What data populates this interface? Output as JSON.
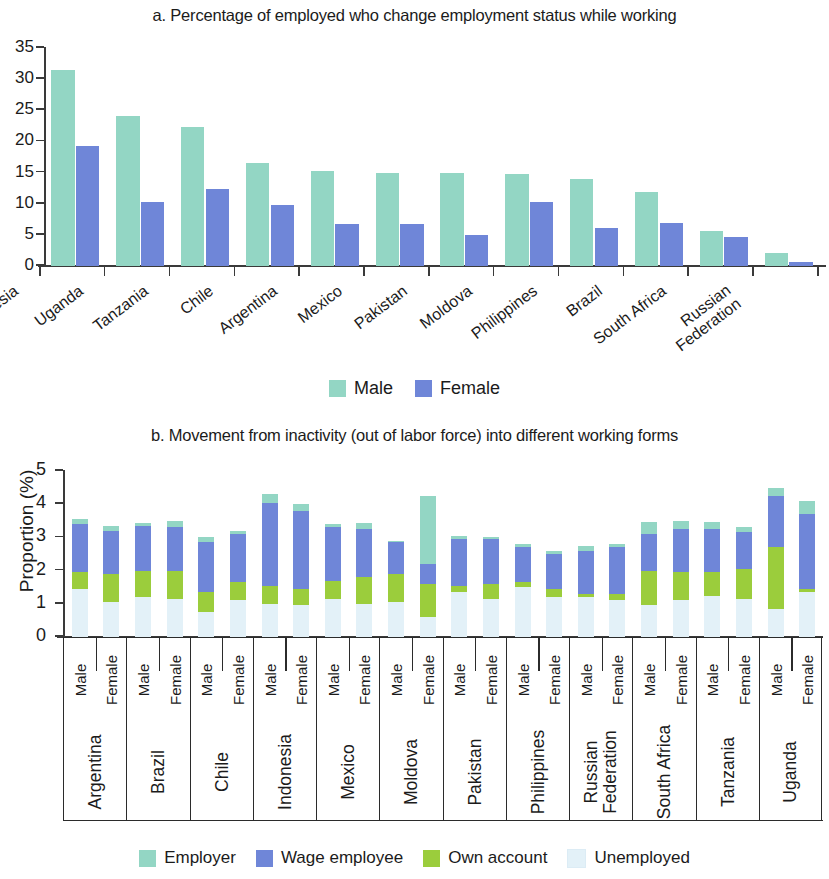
{
  "panel_a": {
    "title": "a. Percentage of employed who change employment status while working",
    "legend": [
      {
        "label": "Male",
        "color": "#93d6c4"
      },
      {
        "label": "Female",
        "color": "#6f86d8"
      }
    ],
    "y_ticks": [
      "0",
      "5",
      "10",
      "15",
      "20",
      "25",
      "30",
      "35"
    ],
    "chart_data": {
      "type": "bar",
      "title": "a. Percentage of employed who change employment status while working",
      "xlabel": "",
      "ylabel": "",
      "ylim": [
        0,
        35
      ],
      "ytick_step": 5,
      "grid": false,
      "legend_position": "bottom",
      "categories": [
        "Indonesia",
        "Uganda",
        "Tanzania",
        "Chile",
        "Argentina",
        "Mexico",
        "Pakistan",
        "Moldova",
        "Philippines",
        "Brazil",
        "South Africa",
        "Russian Federation"
      ],
      "series": [
        {
          "name": "Male",
          "color": "#93d6c4",
          "values": [
            31.4,
            24.1,
            22.3,
            16.5,
            15.3,
            14.9,
            14.9,
            14.7,
            13.9,
            11.9,
            5.6,
            2.1
          ]
        },
        {
          "name": "Female",
          "color": "#6f86d8",
          "values": [
            19.3,
            10.3,
            12.3,
            9.8,
            6.7,
            6.7,
            5.0,
            10.2,
            6.1,
            6.9,
            4.7,
            0.7
          ]
        }
      ]
    }
  },
  "panel_b": {
    "title": "b. Movement from inactivity (out of labor force) into different working forms",
    "y_axis_label": "Proportion (%)",
    "y_ticks": [
      "0",
      "1",
      "2",
      "3",
      "4",
      "5"
    ],
    "sex_labels": [
      "Male",
      "Female"
    ],
    "legend": [
      {
        "label": "Employer",
        "color": "#93d6c4"
      },
      {
        "label": "Wage employee",
        "color": "#6f86d8"
      },
      {
        "label": "Own account",
        "color": "#9bcd3c"
      },
      {
        "label": "Unemployed",
        "color": "#e3f1f8"
      }
    ],
    "chart_data": {
      "type": "bar",
      "subtype": "stacked",
      "title": "b. Movement from inactivity (out of labor force) into different working forms",
      "xlabel": "",
      "ylabel": "Proportion (%)",
      "ylim": [
        0,
        5
      ],
      "ytick_step": 1,
      "grid": false,
      "legend_position": "bottom",
      "stack_order_bottom_to_top": [
        "Unemployed",
        "Own account",
        "Wage employee",
        "Employer"
      ],
      "categories": [
        {
          "country": "Argentina",
          "sex": "Male"
        },
        {
          "country": "Argentina",
          "sex": "Female"
        },
        {
          "country": "Brazil",
          "sex": "Male"
        },
        {
          "country": "Brazil",
          "sex": "Female"
        },
        {
          "country": "Chile",
          "sex": "Male"
        },
        {
          "country": "Chile",
          "sex": "Female"
        },
        {
          "country": "Indonesia",
          "sex": "Male"
        },
        {
          "country": "Indonesia",
          "sex": "Female"
        },
        {
          "country": "Mexico",
          "sex": "Male"
        },
        {
          "country": "Mexico",
          "sex": "Female"
        },
        {
          "country": "Moldova",
          "sex": "Male"
        },
        {
          "country": "Moldova",
          "sex": "Female"
        },
        {
          "country": "Pakistan",
          "sex": "Male"
        },
        {
          "country": "Pakistan",
          "sex": "Female"
        },
        {
          "country": "Philippines",
          "sex": "Male"
        },
        {
          "country": "Philippines",
          "sex": "Female"
        },
        {
          "country": "Russian Federation",
          "sex": "Male"
        },
        {
          "country": "Russian Federation",
          "sex": "Female"
        },
        {
          "country": "South Africa",
          "sex": "Male"
        },
        {
          "country": "South Africa",
          "sex": "Female"
        },
        {
          "country": "Tanzania",
          "sex": "Male"
        },
        {
          "country": "Tanzania",
          "sex": "Female"
        },
        {
          "country": "Uganda",
          "sex": "Male"
        },
        {
          "country": "Uganda",
          "sex": "Female"
        }
      ],
      "series": [
        {
          "name": "Unemployed",
          "color": "#e3f1f8",
          "values": [
            1.45,
            1.05,
            1.2,
            1.15,
            0.75,
            1.1,
            1.0,
            0.95,
            1.15,
            1.0,
            1.05,
            0.6,
            1.35,
            1.15,
            1.5,
            1.2,
            1.2,
            1.1,
            0.95,
            1.1,
            1.25,
            1.15,
            0.85,
            1.35
          ]
        },
        {
          "name": "Own account",
          "color": "#9bcd3c",
          "values": [
            0.5,
            0.85,
            0.8,
            0.85,
            0.6,
            0.55,
            0.55,
            0.5,
            0.55,
            0.8,
            0.85,
            1.0,
            0.2,
            0.45,
            0.15,
            0.25,
            0.1,
            0.2,
            1.05,
            0.85,
            0.7,
            0.9,
            1.85,
            0.1
          ]
        },
        {
          "name": "Wage employee",
          "color": "#6f86d8",
          "values": [
            1.45,
            1.3,
            1.35,
            1.3,
            1.5,
            1.45,
            2.5,
            2.35,
            1.6,
            1.45,
            0.95,
            0.6,
            1.4,
            1.35,
            1.05,
            1.05,
            1.3,
            1.4,
            1.1,
            1.3,
            1.3,
            1.1,
            1.55,
            2.25
          ]
        },
        {
          "name": "Employer",
          "color": "#93d6c4",
          "values": [
            0.15,
            0.15,
            0.1,
            0.2,
            0.15,
            0.1,
            0.25,
            0.2,
            0.1,
            0.2,
            0.05,
            2.05,
            0.1,
            0.05,
            0.1,
            0.1,
            0.15,
            0.1,
            0.35,
            0.25,
            0.2,
            0.15,
            0.25,
            0.4
          ]
        }
      ]
    }
  }
}
